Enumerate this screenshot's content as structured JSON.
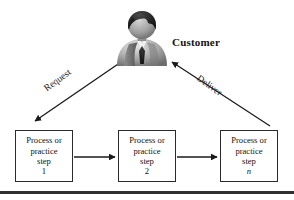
{
  "diagram": {
    "background_color": "#ffffff",
    "line_color": "#1a1a1a",
    "box_border_color": "#2b2b2b",
    "rule_color": "#2f2f2f",
    "actor": {
      "icon": "customer-person-icon",
      "label": "Customer"
    },
    "flows": [
      {
        "id": "request",
        "label": "Request",
        "from": "Customer",
        "to": "Process or practice step 1",
        "direction": "down-left"
      },
      {
        "id": "deliver",
        "label": "Deliver",
        "from": "Process or practice step n",
        "to": "Customer",
        "direction": "up-left"
      }
    ],
    "steps": [
      {
        "id": "step-1",
        "line1": "Process or",
        "line2": "practice",
        "step_word": "step",
        "step_id": "1",
        "step_italic": false
      },
      {
        "id": "step-2",
        "line1": "Process or",
        "line2": "practice",
        "step_word": "step",
        "step_id": "2",
        "step_italic": false
      },
      {
        "id": "step-n",
        "line1": "Process or",
        "line2": "practice",
        "step_word": "step",
        "step_id": "n",
        "step_italic": true
      }
    ],
    "connectors": [
      {
        "id": "step1-to-step2",
        "from": "step-1",
        "to": "step-2",
        "style": "solid-arrow"
      },
      {
        "id": "step2-to-stepn",
        "from": "step-2",
        "to": "step-n",
        "style": "solid-arrow"
      }
    ]
  }
}
